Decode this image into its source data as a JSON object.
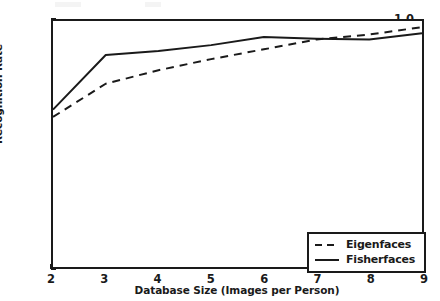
{
  "chart_data": {
    "type": "line",
    "title": "",
    "xlabel": "Database Size (Images per Person)",
    "ylabel": "Recognition Rate",
    "x": [
      2,
      3,
      4,
      5,
      6,
      7,
      8,
      9
    ],
    "xlim": [
      2,
      9
    ],
    "ylim": [
      0.0,
      1.0
    ],
    "xticks": [
      "2",
      "3",
      "4",
      "5",
      "6",
      "7",
      "8",
      "9"
    ],
    "yticks": [
      "0.0",
      "0.2",
      "0.4",
      "0.6",
      "0.8",
      "1.0"
    ],
    "grid": false,
    "legend_position": "lower right",
    "series": [
      {
        "name": "Eigenfaces",
        "style": "dashed",
        "color": "#1a1a1a",
        "values": [
          0.61,
          0.745,
          0.8,
          0.845,
          0.885,
          0.925,
          0.945,
          0.975
        ]
      },
      {
        "name": "Fisherfaces",
        "style": "solid",
        "color": "#1a1a1a",
        "values": [
          0.64,
          0.862,
          0.878,
          0.902,
          0.935,
          0.928,
          0.925,
          0.95
        ]
      }
    ]
  },
  "axes": {
    "ylabel": "Recognition Rate",
    "xlabel": "Database Size (Images per Person)",
    "ytick_labels": [
      "1.0",
      "0.8",
      "0.6",
      "0.4",
      "0.2",
      "0.0"
    ],
    "xtick_labels": [
      "2",
      "3",
      "4",
      "5",
      "6",
      "7",
      "8",
      "9"
    ]
  },
  "legend": {
    "entries": [
      {
        "label": "Eigenfaces",
        "style": "dashed"
      },
      {
        "label": "Fisherfaces",
        "style": "solid"
      }
    ]
  },
  "colors": {
    "line": "#1a1a1a",
    "axis": "#1a1a1a",
    "background": "#ffffff"
  }
}
